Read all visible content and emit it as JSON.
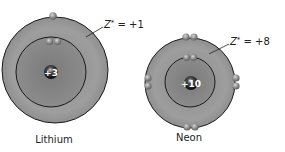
{
  "atoms": [
    {
      "name": "Lithium",
      "nuclear_charge": "+3",
      "effective_charge_label": "Z* = +1",
      "z_symbol": "Z",
      "z_superscript": "*",
      "z_value": " = +1",
      "electrons": {
        "inner": 2,
        "outer": 1
      }
    },
    {
      "name": "Neon",
      "nuclear_charge": "+10",
      "effective_charge_label": "Z* = +8",
      "z_symbol": "Z",
      "z_superscript": "*",
      "z_value": " = +8",
      "electrons": {
        "inner": 2,
        "outer": 8
      }
    }
  ],
  "colors": {
    "outer_shell": "#9a9a9a",
    "inner_shell": "#858585",
    "shell_line": "#1a1a1a",
    "nucleus": "#1e1e1e",
    "electron": "#8c8c8c",
    "text": "#222222"
  }
}
